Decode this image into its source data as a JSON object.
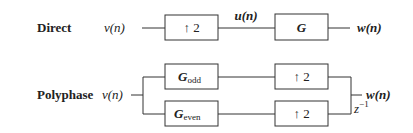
{
  "direct": {
    "title": "Direct",
    "input": "v(n)",
    "upsampler": "↑ 2",
    "intermediate": "u(n)",
    "filter": "G",
    "output": "w(n)"
  },
  "polyphase": {
    "title": "Polyphase",
    "input": "v(n)",
    "filter_odd_base": "G",
    "filter_odd_sub": "odd",
    "filter_even_base": "G",
    "filter_even_sub": "even",
    "upsampler_top": "↑ 2",
    "upsampler_bottom": "↑ 2",
    "delay": "z",
    "delay_exp": "−1",
    "output": "w(n)"
  }
}
